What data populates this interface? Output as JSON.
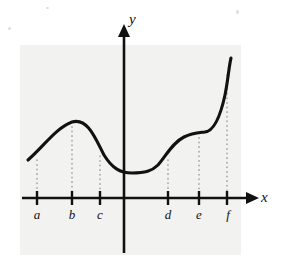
{
  "figure": {
    "background_color": "#ffffff",
    "panel_color": "#f2f2f0",
    "curve_color": "#111111",
    "axis_color": "#111111",
    "dotted_color": "#9a9a9a"
  },
  "axes": {
    "x_label": "x",
    "y_label": "y",
    "x_axis_y_px": 198,
    "y_axis_x_px": 124,
    "x_axis_start_px": 22,
    "x_axis_end_px": 252,
    "y_axis_top_px": 30,
    "y_axis_bottom_px": 253
  },
  "ticks": [
    {
      "label": "a",
      "x_px": 37
    },
    {
      "label": "b",
      "x_px": 72
    },
    {
      "label": "c",
      "x_px": 100
    },
    {
      "label": "d",
      "x_px": 168
    },
    {
      "label": "e",
      "x_px": 199
    },
    {
      "label": "f",
      "x_px": 227
    }
  ],
  "dotted_guides": [
    {
      "for": "a",
      "x_px": 37,
      "from_y_px": 160,
      "to_y_px": 194
    },
    {
      "for": "b",
      "x_px": 72,
      "from_y_px": 122,
      "to_y_px": 194
    },
    {
      "for": "c",
      "x_px": 100,
      "from_y_px": 156,
      "to_y_px": 194
    },
    {
      "for": "d",
      "x_px": 168,
      "from_y_px": 160,
      "to_y_px": 194
    },
    {
      "for": "e",
      "x_px": 199,
      "from_y_px": 133,
      "to_y_px": 194
    },
    {
      "for": "f",
      "x_px": 227,
      "from_y_px": 75,
      "to_y_px": 194
    }
  ],
  "chart_data": {
    "type": "line",
    "title": "",
    "xlabel": "x",
    "ylabel": "y",
    "grid": false,
    "legend": null,
    "categories": [
      "a",
      "b",
      "c",
      "d",
      "e",
      "f"
    ],
    "annotations": [
      "local maximum at x = b",
      "local minimum plateau between x = c and x = d",
      "inflection / flat plateau near x = e",
      "steep increase after x = e toward x = f"
    ],
    "curve_path_px": "M28,160 C44,146 56,128 72,122 C88,117 96,140 104,155 C112,168 120,173 132,173 C145,173 152,171 158,165 C166,156 172,143 184,137 C192,133 196,133 205,132 C214,131 220,118 225,95 C228,80 229,66 231,58",
    "points_px": [
      {
        "label": "start",
        "x": 28,
        "y": 160
      },
      {
        "label": "b",
        "x": 72,
        "y": 122
      },
      {
        "label": "c",
        "x": 100,
        "y": 156
      },
      {
        "label": "min",
        "x": 135,
        "y": 173
      },
      {
        "label": "d",
        "x": 168,
        "y": 160
      },
      {
        "label": "e",
        "x": 199,
        "y": 133
      },
      {
        "label": "f",
        "x": 227,
        "y": 75
      },
      {
        "label": "end",
        "x": 231,
        "y": 58
      }
    ]
  }
}
